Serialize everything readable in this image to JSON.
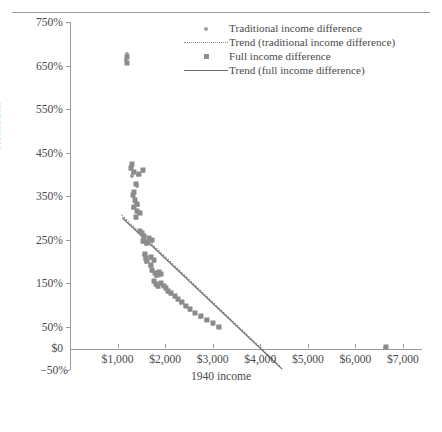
{
  "chart_data": {
    "type": "scatter",
    "title": "",
    "xlabel": "1940 income",
    "ylabel": "Reduction",
    "xlim": [
      0,
      7400
    ],
    "ylim": [
      -50,
      750
    ],
    "grid": false,
    "legend_position": "top-right",
    "y_ticks": [
      "750%",
      "650%",
      "550%",
      "450%",
      "350%",
      "250%",
      "150%",
      "50%"
    ],
    "y_tick_values": [
      750,
      650,
      550,
      450,
      350,
      250,
      150,
      50
    ],
    "y_axis_zero_label": "$0",
    "y_axis_min_label": "−50%",
    "x_ticks": [
      "$1,000",
      "$2,000",
      "$3,000",
      "$4,000",
      "$5,000",
      "$6,000",
      "$7,000"
    ],
    "x_tick_values": [
      1000,
      2000,
      3000,
      4000,
      5000,
      6000,
      7000
    ],
    "series": [
      {
        "name": "Traditional income difference",
        "marker": "dot",
        "color": "#9d9d9d",
        "points": [
          [
            1190,
            677
          ],
          [
            1185,
            662
          ],
          [
            1310,
            420
          ],
          [
            1290,
            412
          ],
          [
            1330,
            404
          ],
          [
            1300,
            396
          ],
          [
            1420,
            398
          ],
          [
            1530,
            408
          ],
          [
            1400,
            372
          ],
          [
            1345,
            356
          ],
          [
            1320,
            350
          ],
          [
            1360,
            344
          ],
          [
            1375,
            336
          ],
          [
            1420,
            330
          ],
          [
            1330,
            322
          ],
          [
            1400,
            314
          ],
          [
            1470,
            310
          ],
          [
            1390,
            300
          ],
          [
            1470,
            268
          ],
          [
            1510,
            262
          ],
          [
            1545,
            256
          ],
          [
            1530,
            244
          ],
          [
            1600,
            240
          ],
          [
            1660,
            252
          ],
          [
            1720,
            246
          ],
          [
            1560,
            214
          ],
          [
            1585,
            206
          ],
          [
            1600,
            198
          ],
          [
            1700,
            208
          ],
          [
            1760,
            200
          ],
          [
            1690,
            190
          ],
          [
            1720,
            178
          ],
          [
            1780,
            172
          ],
          [
            1810,
            166
          ],
          [
            1860,
            174
          ],
          [
            1900,
            168
          ],
          [
            1760,
            152
          ],
          [
            1800,
            146
          ],
          [
            1840,
            140
          ],
          [
            1900,
            148
          ],
          [
            1960,
            142
          ],
          [
            2010,
            136
          ],
          [
            2060,
            130
          ],
          [
            2120,
            124
          ],
          [
            2200,
            118
          ],
          [
            2260,
            112
          ],
          [
            2340,
            104
          ],
          [
            2420,
            96
          ],
          [
            2520,
            88
          ],
          [
            2620,
            80
          ],
          [
            2740,
            72
          ],
          [
            2860,
            64
          ],
          [
            3000,
            56
          ],
          [
            3120,
            48
          ],
          [
            6620,
            0
          ]
        ]
      },
      {
        "name": "Full income difference",
        "marker": "square",
        "color": "#8b8b8b",
        "points": [
          [
            1195,
            670
          ],
          [
            1190,
            655
          ],
          [
            1300,
            424
          ],
          [
            1285,
            414
          ],
          [
            1340,
            406
          ],
          [
            1445,
            400
          ],
          [
            1540,
            410
          ],
          [
            1395,
            378
          ],
          [
            1350,
            360
          ],
          [
            1325,
            352
          ],
          [
            1370,
            340
          ],
          [
            1415,
            332
          ],
          [
            1335,
            324
          ],
          [
            1405,
            316
          ],
          [
            1465,
            312
          ],
          [
            1385,
            302
          ],
          [
            1480,
            270
          ],
          [
            1520,
            264
          ],
          [
            1555,
            258
          ],
          [
            1540,
            246
          ],
          [
            1610,
            242
          ],
          [
            1670,
            254
          ],
          [
            1730,
            248
          ],
          [
            1570,
            216
          ],
          [
            1595,
            208
          ],
          [
            1610,
            200
          ],
          [
            1710,
            210
          ],
          [
            1770,
            202
          ],
          [
            1700,
            192
          ],
          [
            1730,
            180
          ],
          [
            1790,
            174
          ],
          [
            1820,
            168
          ],
          [
            1870,
            176
          ],
          [
            1910,
            170
          ],
          [
            1770,
            154
          ],
          [
            1810,
            148
          ],
          [
            1850,
            142
          ],
          [
            1910,
            150
          ],
          [
            1970,
            144
          ],
          [
            2020,
            138
          ],
          [
            2070,
            132
          ],
          [
            2130,
            126
          ],
          [
            2210,
            120
          ],
          [
            2270,
            114
          ],
          [
            2350,
            106
          ],
          [
            2430,
            98
          ],
          [
            2530,
            90
          ],
          [
            2630,
            82
          ],
          [
            2750,
            74
          ],
          [
            2870,
            66
          ],
          [
            3010,
            58
          ],
          [
            3130,
            50
          ],
          [
            6640,
            2
          ]
        ]
      }
    ],
    "trend_lines": [
      {
        "name": "Trend (traditional income difference)",
        "style": "dotted",
        "color": "#8a8a8a",
        "x0": 1080,
        "y0": 307,
        "x1": 4420,
        "y1": -42
      },
      {
        "name": "Trend (full income difference)",
        "style": "solid",
        "color": "#6e6e6e",
        "x0": 1100,
        "y0": 300,
        "x1": 4460,
        "y1": -48
      }
    ],
    "legend": [
      {
        "label": "Traditional income difference",
        "key": "dot",
        "color": "#9d9d9d"
      },
      {
        "label": "Trend (traditional income difference)",
        "key": "dotted-line",
        "color": "#8a8a8a"
      },
      {
        "label": "Full income difference",
        "key": "square",
        "color": "#8f8f8f"
      },
      {
        "label": "Trend (full income difference)",
        "key": "solid-line",
        "color": "#6e6e6e"
      }
    ]
  }
}
